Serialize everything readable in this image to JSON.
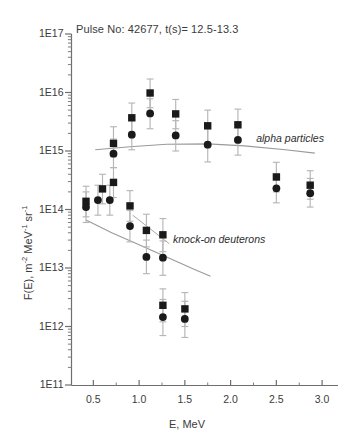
{
  "chart_data": {
    "type": "scatter",
    "title": "Pulse No: 42677, t(s)= 12.5-13.3",
    "xlabel": "E, MeV",
    "ylabel": "F(E), m-2 MeV-1 sr-1",
    "ylabel_parts": {
      "prefix": "F(E), m",
      "sup1": "-2",
      "mid": " MeV",
      "sup2": "-1",
      "mid2": " sr",
      "sup3": "-1"
    },
    "xlim": [
      0.3,
      3.25
    ],
    "ylim": [
      100000000000.0,
      1e+17
    ],
    "yscale": "log",
    "xscale": "linear",
    "grid": false,
    "legend_position": "inline-annotations",
    "xticks": [
      0.5,
      1.0,
      1.5,
      2.0,
      2.5,
      3.0
    ],
    "xtick_labels": [
      "0.5",
      "1.0",
      "1.5",
      "2.0",
      "2.5",
      "3.0"
    ],
    "yticks": [
      100000000000.0,
      1000000000000.0,
      10000000000000.0,
      100000000000000.0,
      1000000000000000.0,
      1e+16,
      1e+17
    ],
    "ytick_labels": [
      "1E11",
      "1E12",
      "1E13",
      "1E14",
      "1E15",
      "1E16",
      "1E17"
    ],
    "minor_ticks": "log-decade-subdivisions",
    "annotations": [
      {
        "text": "alpha particles",
        "x": 2.28,
        "y": 1600000000000000.0,
        "style": "italic"
      },
      {
        "text": "knock-on deuterons",
        "x": 1.37,
        "y": 30000000000000.0,
        "style": "italic"
      }
    ],
    "series": [
      {
        "name": "alpha particles (squares)",
        "marker": "square",
        "color": "#1a1a1a",
        "points": [
          {
            "x": 0.72,
            "y": 1350000000000000.0,
            "yerr_low": 800000000000000.0,
            "yerr_high": 2600000000000000.0
          },
          {
            "x": 0.92,
            "y": 3700000000000000.0,
            "yerr_low": 2100000000000000.0,
            "yerr_high": 6600000000000000.0
          },
          {
            "x": 1.12,
            "y": 9800000000000000.0,
            "yerr_low": 5500000000000000.0,
            "yerr_high": 1.7e+16
          },
          {
            "x": 1.4,
            "y": 4300000000000000.0,
            "yerr_low": 2400000000000000.0,
            "yerr_high": 7600000000000000.0
          },
          {
            "x": 1.75,
            "y": 2700000000000000.0,
            "yerr_low": 1400000000000000.0,
            "yerr_high": 5000000000000000.0
          },
          {
            "x": 2.08,
            "y": 2800000000000000.0,
            "yerr_low": 1500000000000000.0,
            "yerr_high": 5200000000000000.0
          },
          {
            "x": 2.5,
            "y": 360000000000000.0,
            "yerr_low": 200000000000000.0,
            "yerr_high": 640000000000000.0
          },
          {
            "x": 2.87,
            "y": 260000000000000.0,
            "yerr_low": 150000000000000.0,
            "yerr_high": 460000000000000.0
          }
        ]
      },
      {
        "name": "alpha particles (circles)",
        "marker": "circle",
        "color": "#1a1a1a",
        "points": [
          {
            "x": 0.72,
            "y": 900000000000000.0,
            "yerr_low": 520000000000000.0,
            "yerr_high": 1600000000000000.0
          },
          {
            "x": 0.92,
            "y": 1900000000000000.0,
            "yerr_low": 1050000000000000.0,
            "yerr_high": 3400000000000000.0
          },
          {
            "x": 1.12,
            "y": 4400000000000000.0,
            "yerr_low": 2400000000000000.0,
            "yerr_high": 7800000000000000.0
          },
          {
            "x": 1.4,
            "y": 1850000000000000.0,
            "yerr_low": 1000000000000000.0,
            "yerr_high": 3300000000000000.0
          },
          {
            "x": 1.75,
            "y": 1280000000000000.0,
            "yerr_low": 650000000000000.0,
            "yerr_high": 2400000000000000.0
          },
          {
            "x": 2.08,
            "y": 1550000000000000.0,
            "yerr_low": 850000000000000.0,
            "yerr_high": 2800000000000000.0
          },
          {
            "x": 2.5,
            "y": 230000000000000.0,
            "yerr_low": 130000000000000.0,
            "yerr_high": 410000000000000.0
          },
          {
            "x": 2.87,
            "y": 190000000000000.0,
            "yerr_low": 110000000000000.0,
            "yerr_high": 340000000000000.0
          }
        ]
      },
      {
        "name": "knock-on deuterons (squares)",
        "marker": "square",
        "color": "#1a1a1a",
        "points": [
          {
            "x": 0.42,
            "y": 138000000000000.0,
            "yerr_low": 75000000000000.0,
            "yerr_high": 250000000000000.0
          },
          {
            "x": 0.6,
            "y": 225000000000000.0,
            "yerr_low": 125000000000000.0,
            "yerr_high": 400000000000000.0
          },
          {
            "x": 0.72,
            "y": 290000000000000.0,
            "yerr_low": 160000000000000.0,
            "yerr_high": 520000000000000.0
          },
          {
            "x": 0.9,
            "y": 115000000000000.0,
            "yerr_low": 63000000000000.0,
            "yerr_high": 210000000000000.0
          },
          {
            "x": 1.08,
            "y": 44000000000000.0,
            "yerr_low": 23000000000000.0,
            "yerr_high": 83000000000000.0
          },
          {
            "x": 1.26,
            "y": 37000000000000.0,
            "yerr_low": 19000000000000.0,
            "yerr_high": 70000000000000.0
          },
          {
            "x": 1.26,
            "y": 2300000000000.0,
            "yerr_low": 1200000000000.0,
            "yerr_high": 4400000000000.0
          },
          {
            "x": 1.5,
            "y": 2000000000000.0,
            "yerr_low": 1000000000000.0,
            "yerr_high": 3800000000000.0
          }
        ]
      },
      {
        "name": "knock-on deuterons (circles)",
        "marker": "circle",
        "color": "#1a1a1a",
        "points": [
          {
            "x": 0.42,
            "y": 110000000000000.0,
            "yerr_low": 60000000000000.0,
            "yerr_high": 200000000000000.0
          },
          {
            "x": 0.55,
            "y": 145000000000000.0,
            "yerr_low": 80000000000000.0,
            "yerr_high": 260000000000000.0
          },
          {
            "x": 0.68,
            "y": 145000000000000.0,
            "yerr_low": 80000000000000.0,
            "yerr_high": 260000000000000.0
          },
          {
            "x": 0.9,
            "y": 52000000000000.0,
            "yerr_low": 28000000000000.0,
            "yerr_high": 96000000000000.0
          },
          {
            "x": 1.08,
            "y": 15500000000000.0,
            "yerr_low": 8000000000000.0,
            "yerr_high": 30000000000000.0
          },
          {
            "x": 1.26,
            "y": 15000000000000.0,
            "yerr_low": 7500000000000.0,
            "yerr_high": 29000000000000.0
          },
          {
            "x": 1.26,
            "y": 1450000000000.0,
            "yerr_low": 700000000000.0,
            "yerr_high": 2900000000000.0
          },
          {
            "x": 1.5,
            "y": 1350000000000.0,
            "yerr_low": 650000000000.0,
            "yerr_high": 2700000000000.0
          }
        ]
      }
    ],
    "trend_lines": [
      {
        "name": "alpha trend",
        "color": "#9a9a9a",
        "points": [
          {
            "x": 0.52,
            "y": 1050000000000000.0
          },
          {
            "x": 0.9,
            "y": 1180000000000000.0
          },
          {
            "x": 1.3,
            "y": 1300000000000000.0
          },
          {
            "x": 1.75,
            "y": 1320000000000000.0
          },
          {
            "x": 2.15,
            "y": 1220000000000000.0
          },
          {
            "x": 2.6,
            "y": 1050000000000000.0
          },
          {
            "x": 2.92,
            "y": 920000000000000.0
          }
        ]
      },
      {
        "name": "knock-on deuteron trend",
        "color": "#9a9a9a",
        "points": [
          {
            "x": 0.42,
            "y": 66000000000000.0
          },
          {
            "x": 0.7,
            "y": 40000000000000.0
          },
          {
            "x": 1.0,
            "y": 25000000000000.0
          },
          {
            "x": 1.3,
            "y": 15500000000000.0
          },
          {
            "x": 1.6,
            "y": 9500000000000.0
          },
          {
            "x": 1.78,
            "y": 7200000000000.0
          }
        ]
      }
    ],
    "annotation_leaders": [
      {
        "name": "knock-on-leader",
        "from": {
          "x": 1.33,
          "y": 26000000000000.0
        },
        "to": {
          "x": 0.93,
          "y": 80000000000000.0
        }
      }
    ]
  },
  "axes": {
    "title": "Pulse No: 42677, t(s)= 12.5-13.3",
    "x_title": "E, MeV",
    "y_title_prefix": "F(E), m",
    "y_title_sup1": "-2",
    "y_title_mid": " MeV",
    "y_title_sup2": "-1",
    "y_title_mid2": " sr",
    "y_title_sup3": "-1"
  }
}
